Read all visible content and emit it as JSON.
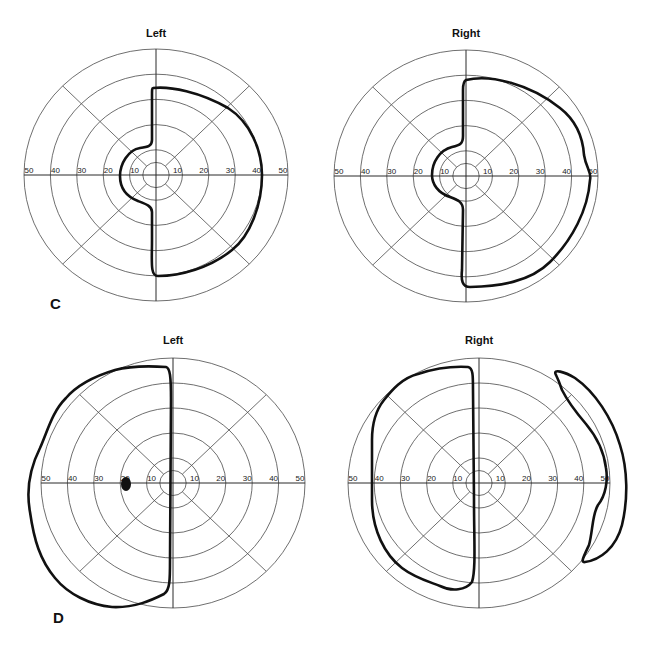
{
  "panels": [
    {
      "label": "C",
      "x": 50,
      "y": 309
    },
    {
      "label": "D",
      "x": 53,
      "y": 623
    }
  ],
  "charts": [
    {
      "id": "C-left",
      "title": "Left",
      "cx": 156,
      "cy": 175,
      "rx": 132,
      "ry": 126,
      "title_y": 37,
      "isopters": [
        "M153,88 C170,86 200,92 228,108 C250,122 262,150 262,175 C262,205 250,236 232,250 C210,268 180,276 158,276 C150,276 152,262 152,240 L152,212 C152,206 146,204 138,201 C125,196 120,186 120,176 C120,164 128,150 140,148 C148,147 152,146 152,140 L152,96 C152,90 152,88 153,88 Z"
      ],
      "blind_spots": []
    },
    {
      "id": "C-right",
      "title": "Right",
      "cx": 466,
      "cy": 176,
      "rx": 132,
      "ry": 126,
      "title_y": 37,
      "isopters": [
        "M466,80 C490,74 530,84 560,108 C578,122 583,140 584,155 C586,168 592,172 590,180 C588,210 572,240 550,262 C530,282 500,286 470,287 C462,287 461,280 462,270 L463,210 C463,202 458,200 450,197 C438,193 432,184 432,175 C432,162 440,150 452,147 C460,145 463,144 463,136 L463,90 C463,84 464,81 466,80 Z"
      ],
      "blind_spots": []
    },
    {
      "id": "D-left",
      "title": "Left",
      "cx": 173,
      "cy": 483,
      "rx": 132,
      "ry": 125,
      "title_y": 344,
      "isopters": [
        "M166,367 C150,366 130,366 115,370 C95,376 78,384 66,398 C52,412 48,430 40,448 C30,468 26,490 30,512 C34,540 40,560 55,578 C68,594 90,605 112,607 C135,608 152,600 164,594 C170,590 170,580 170,560 L171,400 C171,376 170,368 166,367 Z"
      ],
      "blind_spots": [
        {
          "cx": 126,
          "cy": 484,
          "rx": 5,
          "ry": 7
        }
      ]
    },
    {
      "id": "D-right",
      "title": "Right",
      "cx": 479,
      "cy": 483,
      "rx": 131,
      "ry": 125,
      "title_y": 344,
      "isopters": [
        "M468,367 C450,366 430,370 418,374 C402,378 392,390 384,400 C376,410 372,425 372,440 L372,500 C372,530 385,555 402,568 C415,578 430,582 440,586 C452,592 466,590 472,582 C476,570 474,540 474,500 L473,390 C473,375 473,368 468,367 Z",
        "M556,375 C552,368 565,372 575,378 C595,392 612,418 620,445 C628,470 628,500 622,525 C616,548 600,560 585,562 C580,563 584,556 589,545 C593,530 592,515 598,505 C606,495 608,480 606,468 C604,452 596,436 586,424 C574,410 566,398 562,390 C560,384 558,379 556,375 Z"
      ],
      "blind_spots": []
    }
  ],
  "axis": {
    "tick_labels_left": [
      "50",
      "40",
      "30",
      "20",
      "10"
    ],
    "tick_labels_right": [
      "10",
      "20",
      "30",
      "40",
      "50"
    ],
    "ring_values": [
      5,
      10,
      20,
      30,
      40,
      50
    ],
    "max": 50
  },
  "colors": {
    "grid": "#4a4a4a",
    "isopter": "#111111",
    "background": "#ffffff"
  }
}
